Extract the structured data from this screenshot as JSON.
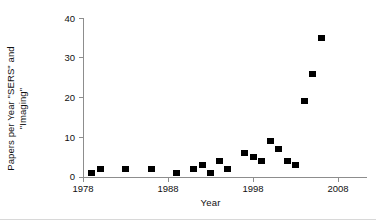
{
  "chart_data": {
    "type": "scatter",
    "title": "",
    "xlabel": "Year",
    "ylabel": "Papers per Year \"SERS\" and \"Imaging\"",
    "xlim": [
      1978,
      2008
    ],
    "ylim": [
      0,
      40
    ],
    "xticks": [
      1978,
      1988,
      1998,
      2008
    ],
    "xtick_labels": [
      "1978",
      "1988",
      "1998",
      "2008"
    ],
    "yticks": [
      0,
      10,
      20,
      30,
      40
    ],
    "ytick_labels": [
      "0",
      "10",
      "20",
      "30",
      "40"
    ],
    "grid": false,
    "legend": null,
    "marker_color": "#000000",
    "marker_shape": "square",
    "axis_color": "#8d8d8d",
    "x": [
      1979,
      1980,
      1983,
      1986,
      1989,
      1991,
      1992,
      1993,
      1994,
      1995,
      1996,
      1997,
      1998,
      1999,
      2000,
      2001,
      2002,
      2003,
      2004,
      2005,
      2006
    ],
    "y": [
      1,
      2,
      2,
      2,
      1,
      2,
      3,
      1,
      4,
      2,
      6,
      5,
      4,
      9,
      7,
      4,
      3,
      19,
      26,
      35,
      0
    ],
    "points": [
      {
        "year": 1979,
        "value": 1
      },
      {
        "year": 1980,
        "value": 2
      },
      {
        "year": 1983,
        "value": 2
      },
      {
        "year": 1986,
        "value": 2
      },
      {
        "year": 1989,
        "value": 1
      },
      {
        "year": 1991,
        "value": 2
      },
      {
        "year": 1992,
        "value": 3
      },
      {
        "year": 1993,
        "value": 1
      },
      {
        "year": 1994,
        "value": 4
      },
      {
        "year": 1995,
        "value": 2
      },
      {
        "year": 1997,
        "value": 6
      },
      {
        "year": 1998,
        "value": 5
      },
      {
        "year": 1999,
        "value": 4
      },
      {
        "year": 2000,
        "value": 9
      },
      {
        "year": 2001,
        "value": 7
      },
      {
        "year": 2002,
        "value": 4
      },
      {
        "year": 2003,
        "value": 3
      },
      {
        "year": 2004,
        "value": 19
      },
      {
        "year": 2005,
        "value": 26
      },
      {
        "year": 2006,
        "value": 35
      }
    ]
  },
  "figure": {
    "ylabel_line1": "Papers per Year \"SERS\" and",
    "ylabel_line2": "\"Imaging\"",
    "xlabel": "Year"
  }
}
